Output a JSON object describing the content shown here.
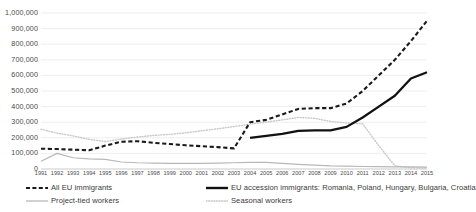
{
  "chart_data": {
    "type": "line",
    "title": "",
    "xlabel": "",
    "ylabel": "",
    "xlim": [
      1991,
      2015
    ],
    "ylim": [
      0,
      1000000
    ],
    "grid": true,
    "grid_axis": "y",
    "legend_position": "bottom",
    "x": [
      1991,
      1992,
      1993,
      1994,
      1995,
      1996,
      1997,
      1998,
      1999,
      2000,
      2001,
      2002,
      2003,
      2004,
      2005,
      2006,
      2007,
      2008,
      2009,
      2010,
      2011,
      2012,
      2013,
      2014,
      2015
    ],
    "xticklabels": [
      "1991",
      "1992",
      "1993",
      "1994",
      "1995",
      "1996",
      "1997",
      "1998",
      "1999",
      "2000",
      "2001",
      "2002",
      "2003",
      "2004",
      "2005",
      "2006",
      "2007",
      "2008",
      "2009",
      "2010",
      "2011",
      "2012",
      "2013",
      "2014",
      "2015"
    ],
    "yticks": [
      0,
      100000,
      200000,
      300000,
      400000,
      500000,
      600000,
      700000,
      800000,
      900000,
      1000000
    ],
    "yticklabels": [
      "0",
      "100,000",
      "200,000",
      "300,000",
      "400,000",
      "500,000",
      "600,000",
      "700,000",
      "800,000",
      "900,000",
      "1,000,000"
    ],
    "series": [
      {
        "name": "All EU immigrants",
        "style": "dashed",
        "color": "#1a1a1a",
        "width": 2.1,
        "values": [
          130000,
          128000,
          124000,
          120000,
          150000,
          175000,
          178000,
          168000,
          160000,
          152000,
          146000,
          140000,
          132000,
          300000,
          315000,
          350000,
          385000,
          390000,
          390000,
          420000,
          500000,
          600000,
          700000,
          820000,
          950000
        ]
      },
      {
        "name": "EU accession immigrants: Romania, Poland, Hungary, Bulgaria, Croatia",
        "style": "solid",
        "color": "#111111",
        "width": 2.3,
        "start_year": 2004,
        "values": [
          null,
          null,
          null,
          null,
          null,
          null,
          null,
          null,
          null,
          null,
          null,
          null,
          null,
          200000,
          212000,
          225000,
          245000,
          248000,
          248000,
          270000,
          330000,
          400000,
          470000,
          580000,
          620000
        ]
      },
      {
        "name": "Project-tied workers",
        "style": "solid",
        "color": "#b8b8b8",
        "width": 1.2,
        "values": [
          50000,
          100000,
          72000,
          65000,
          62000,
          45000,
          40000,
          38000,
          36000,
          36000,
          36000,
          38000,
          40000,
          43000,
          42000,
          36000,
          30000,
          25000,
          20000,
          18000,
          16000,
          15000,
          14000,
          13000,
          12000
        ]
      },
      {
        "name": "Seasonal workers",
        "style": "dotted",
        "color": "#c9c9c9",
        "width": 1.4,
        "values": [
          255000,
          230000,
          212000,
          190000,
          176000,
          192000,
          205000,
          215000,
          222000,
          232000,
          245000,
          258000,
          272000,
          288000,
          300000,
          315000,
          330000,
          325000,
          305000,
          295000,
          290000,
          150000,
          20000,
          8000,
          6000
        ]
      }
    ]
  },
  "legend": {
    "items": [
      {
        "label": "All EU immigrants"
      },
      {
        "label": "EU accession immigrants: Romania, Poland, Hungary, Bulgaria, Croatia"
      },
      {
        "label": "Project-tied workers"
      },
      {
        "label": "Seasonal workers"
      }
    ]
  }
}
